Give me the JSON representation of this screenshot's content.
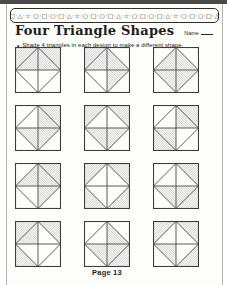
{
  "page": {
    "border_pattern": "·○·□·○·□·△·☆·○·□·○·□·△·☆·○·□·○·□·△·☆·○·□·○·□·△·☆·○·□·○·□·△·☆·○·□·",
    "title": "Four Triangle Shapes",
    "name_label": "Name",
    "bullet": "•",
    "instruction": "Shade 4 triangles in each design to make a different shape.",
    "footer": "Page 13"
  },
  "colors": {
    "ink": "#3c3c3c",
    "hatch": "#6b6b6b",
    "paper": "#fdfdfa",
    "scan_edge": "#4a4a4a"
  },
  "grid": {
    "rows": 4,
    "cols": 3,
    "triangles_per_design": 8,
    "shaded_per_design": 4
  },
  "designs": [
    {
      "id": 1,
      "shaded": [
        "tl_outer",
        "tl_inner",
        "tr_outer",
        "tr_inner"
      ]
    },
    {
      "id": 2,
      "shaded": [
        "tl_outer",
        "tl_inner",
        "tr_inner",
        "br_inner"
      ]
    },
    {
      "id": 3,
      "shaded": [
        "tl_inner",
        "tr_inner",
        "bl_inner",
        "br_inner"
      ]
    },
    {
      "id": 4,
      "shaded": [
        "tr_outer",
        "tr_inner",
        "bl_inner",
        "br_inner"
      ]
    },
    {
      "id": 5,
      "shaded": [
        "tl_outer",
        "tr_outer",
        "bl_inner",
        "br_inner"
      ]
    },
    {
      "id": 6,
      "shaded": [
        "tr_outer",
        "tr_inner",
        "bl_outer",
        "bl_inner"
      ]
    },
    {
      "id": 7,
      "shaded": [
        "tl_inner",
        "tr_outer",
        "tr_inner",
        "br_inner"
      ]
    },
    {
      "id": 8,
      "shaded": [
        "tl_outer",
        "tr_outer",
        "bl_outer",
        "br_outer"
      ]
    },
    {
      "id": 9,
      "shaded": [
        "tr_outer",
        "bl_inner",
        "br_outer",
        "br_inner"
      ]
    },
    {
      "id": 10,
      "shaded": [
        "tl_outer",
        "tl_inner",
        "tr_outer",
        "bl_outer"
      ]
    },
    {
      "id": 11,
      "shaded": [
        "tr_inner",
        "bl_inner",
        "br_outer",
        "br_inner"
      ]
    },
    {
      "id": 12,
      "shaded": [
        "tl_outer",
        "tr_outer",
        "bl_inner",
        "br_outer"
      ]
    }
  ]
}
